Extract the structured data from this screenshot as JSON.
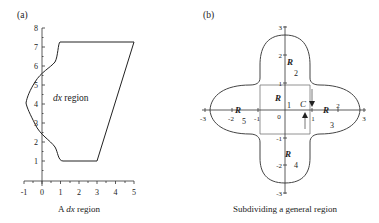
{
  "panel_a": {
    "label": "(a)",
    "caption_prefix": "A ",
    "caption_var": "dx",
    "caption_suffix": " region",
    "region_var": "dx",
    "region_text": " region",
    "x_ticks": [
      "-1",
      "0",
      "1",
      "2",
      "3",
      "4",
      "5"
    ],
    "y_ticks": [
      "1",
      "2",
      "3",
      "4",
      "5",
      "6",
      "7",
      "8"
    ]
  },
  "panel_b": {
    "label": "(b)",
    "caption": "Subdividing a general region",
    "x_ticks": [
      "-3",
      "-2",
      "-1",
      "0",
      "1",
      "2",
      "3"
    ],
    "y_ticks": [
      "3",
      "2",
      "1",
      "-1",
      "-2",
      "-3"
    ],
    "regions": [
      {
        "letter": "R",
        "sub": "1"
      },
      {
        "letter": "R",
        "sub": "2"
      },
      {
        "letter": "R",
        "sub": "3"
      },
      {
        "letter": "R",
        "sub": "4"
      },
      {
        "letter": "R",
        "sub": "5"
      }
    ],
    "curve_label": "C"
  }
}
